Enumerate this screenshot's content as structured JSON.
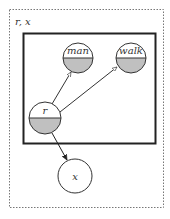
{
  "diagram": {
    "type": "graphical-model-plate-diagram",
    "outer_plate": {
      "label": "r, x",
      "style": "dotted",
      "x": 9,
      "y": 9,
      "width": 154,
      "height": 198
    },
    "inner_plate": {
      "label": "",
      "style": "solid",
      "x": 23,
      "y": 33,
      "width": 132,
      "height": 110
    },
    "nodes": [
      {
        "id": "man",
        "label": "man",
        "cx": 78,
        "cy": 58,
        "r": 15,
        "shading": "bottom-half"
      },
      {
        "id": "walk",
        "label": "walk",
        "cx": 131,
        "cy": 58,
        "r": 15,
        "shading": "bottom-half"
      },
      {
        "id": "r",
        "label": "r",
        "cx": 45,
        "cy": 118,
        "r": 16,
        "shading": "bottom-half"
      },
      {
        "id": "x",
        "label": "x",
        "cx": 75,
        "cy": 176,
        "r": 17,
        "shading": "none"
      }
    ],
    "edges": [
      {
        "from": "r",
        "to": "man",
        "arrowhead": "open"
      },
      {
        "from": "r",
        "to": "walk",
        "arrowhead": "open"
      },
      {
        "from": "r",
        "to": "x",
        "arrowhead": "filled"
      }
    ],
    "colors": {
      "shade": "#c0c0c0",
      "stroke": "#333333",
      "plate_stroke": "#222222",
      "dotted_stroke": "#777777"
    }
  }
}
